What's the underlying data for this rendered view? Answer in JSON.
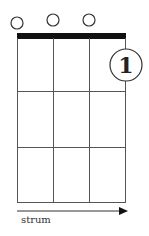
{
  "diagram": {
    "type": "chord-chart",
    "strings": 4,
    "frets_shown": 3,
    "open_strings": [
      1,
      2,
      3
    ],
    "finger_label": "1",
    "strum_label": "strum",
    "colors": {
      "line": "#555555",
      "nut": "#111111",
      "text": "#222222"
    }
  }
}
